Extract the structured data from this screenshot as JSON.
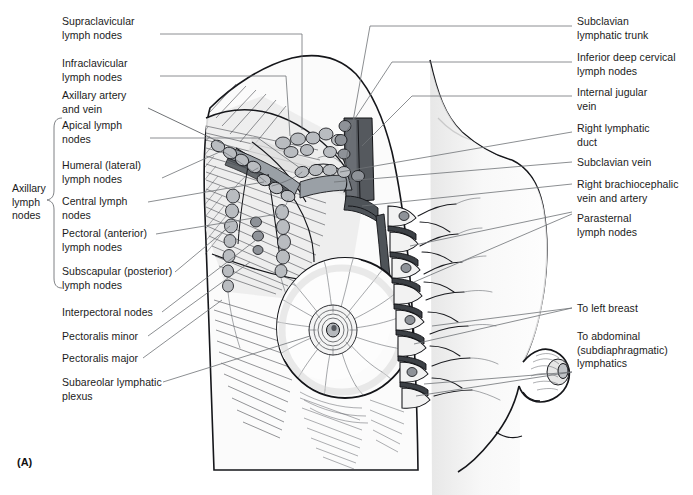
{
  "figure": {
    "panel_letter": "(A)"
  },
  "group_bracket": {
    "label": "Axillary\nlymph\nnodes"
  },
  "labels_left": [
    {
      "id": "supraclavicular-lymph-nodes",
      "text": "Supraclavicular\nlymph nodes"
    },
    {
      "id": "infraclavicular-lymph-nodes",
      "text": "Infraclavicular\nlymph nodes"
    },
    {
      "id": "axillary-artery-and-vein",
      "text": "Axillary artery\nand vein"
    },
    {
      "id": "apical-lymph-nodes",
      "text": "Apical lymph\nnodes"
    },
    {
      "id": "humeral-lateral-lymph-nodes",
      "text": "Humeral (lateral)\nlymph nodes"
    },
    {
      "id": "central-lymph-nodes",
      "text": "Central lymph\nnodes"
    },
    {
      "id": "pectoral-anterior-lymph-nodes",
      "text": "Pectoral (anterior)\nlymph nodes"
    },
    {
      "id": "subscapular-posterior-lymph-nodes",
      "text": "Subscapular (posterior)\nlymph nodes"
    },
    {
      "id": "interpectoral-nodes",
      "text": "Interpectoral nodes"
    },
    {
      "id": "pectoralis-minor",
      "text": "Pectoralis minor"
    },
    {
      "id": "pectoralis-major",
      "text": "Pectoralis major"
    },
    {
      "id": "subareolar-lymphatic-plexus",
      "text": "Subareolar lymphatic\nplexus"
    }
  ],
  "labels_right": [
    {
      "id": "subclavian-lymphatic-trunk",
      "text": "Subclavian\nlymphatic trunk"
    },
    {
      "id": "inferior-deep-cervical-lymph-nodes",
      "text": "Inferior deep cervical\nlymph nodes"
    },
    {
      "id": "internal-jugular-vein",
      "text": "Internal jugular\nvein"
    },
    {
      "id": "right-lymphatic-duct",
      "text": "Right lymphatic\nduct"
    },
    {
      "id": "subclavian-vein",
      "text": "Subclavian vein"
    },
    {
      "id": "right-brachiocephalic-vein-and-artery",
      "text": "Right brachiocephalic\nvein and artery"
    },
    {
      "id": "parasternal-lymph-nodes",
      "text": "Parasternal\nlymph nodes"
    },
    {
      "id": "to-left-breast",
      "text": "To left breast"
    },
    {
      "id": "to-abdominal-lymphatics",
      "text": "To abdominal\n(subdiaphragmatic)\nlymphatics"
    }
  ],
  "colors": {
    "background": "#ffffff",
    "ink": "#1b1b1b",
    "leader": "#6f7276",
    "outline": "#15161a",
    "node_fill": "#b9bcc0",
    "vessel_fill": "#9aa0a6",
    "jugular_fill": "#55595e",
    "tissue_light": "#ececec",
    "tissue_mid": "#dddddd"
  }
}
